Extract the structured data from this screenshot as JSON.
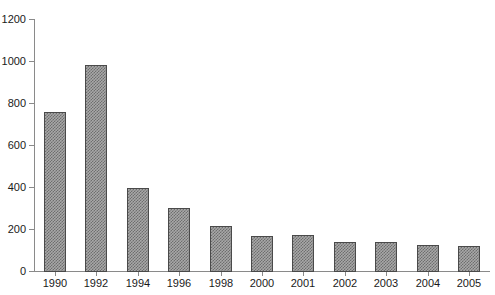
{
  "chart_data": {
    "type": "bar",
    "title": "",
    "subtitle": "",
    "xlabel": "",
    "ylabel": "",
    "categories": [
      "1990",
      "1992",
      "1994",
      "1996",
      "1998",
      "2000",
      "2001",
      "2002",
      "2003",
      "2004",
      "2005"
    ],
    "values": [
      755,
      980,
      395,
      302,
      215,
      168,
      172,
      137,
      138,
      122,
      117
    ],
    "series": [
      {
        "name": "",
        "values": [
          755,
          980,
          395,
          302,
          215,
          168,
          172,
          137,
          138,
          122,
          117
        ]
      }
    ],
    "ylim": [
      0,
      1200
    ],
    "ytick_labels": [
      "0",
      "200",
      "400",
      "600",
      "800",
      "1000",
      "1200"
    ],
    "ytick_values": [
      0,
      200,
      400,
      600,
      800,
      1000,
      1200
    ],
    "grid": false,
    "legend": false,
    "legend_position": "none",
    "annotations": [],
    "colors": {
      "bar_fill": "#a8a8a8",
      "bar_hatch": "#6e6e6e",
      "bar_border": "#4a4a4a",
      "axis": "#8a8a8a",
      "text": "#1a1a1a",
      "background": "#ffffff"
    }
  }
}
